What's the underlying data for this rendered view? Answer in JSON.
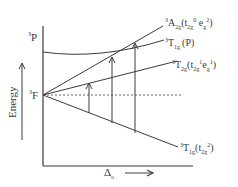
{
  "diagram": {
    "type": "energy-level-correlation",
    "axes": {
      "y_label": "Energy",
      "x_label": "Δo",
      "x_label_main": "Δ",
      "x_label_sub": "o"
    },
    "free_ion_terms": [
      {
        "sup": "3",
        "main": "P"
      },
      {
        "sup": "3",
        "main": "F"
      }
    ],
    "states": [
      {
        "sup": "3",
        "main": "A",
        "sub": "2g",
        "config_pre": "(t",
        "config_sub1": "2g",
        "config_sup1": "0",
        "config_mid": " e",
        "config_sub2": "g",
        "config_sup2": "2",
        "config_post": ")"
      },
      {
        "sup": "3",
        "main": "T",
        "sub": "1g",
        "config": "(P)"
      },
      {
        "sup": "3",
        "main": "T",
        "sub": "2g",
        "config_pre": "(t",
        "config_sub1": "2g",
        "config_sup1": "1",
        "config_mid": "e",
        "config_sub2": "g",
        "config_sup2": "1",
        "config_post": ")"
      },
      {
        "sup": "3",
        "main": "T",
        "sub": "1g",
        "config_pre": "(t",
        "config_sub1": "2g",
        "config_sup1": "2",
        "config_post": ")"
      }
    ],
    "transitions": [
      {
        "from": "3T1g(t2g2)",
        "to": "3T2g"
      },
      {
        "from": "3T1g(t2g2)",
        "to": "3T1g(P)"
      },
      {
        "from": "3T1g(t2g2)",
        "to": "3A2g"
      }
    ],
    "colors": {
      "line": "#3a3a3a",
      "background": "#ffffff"
    }
  }
}
